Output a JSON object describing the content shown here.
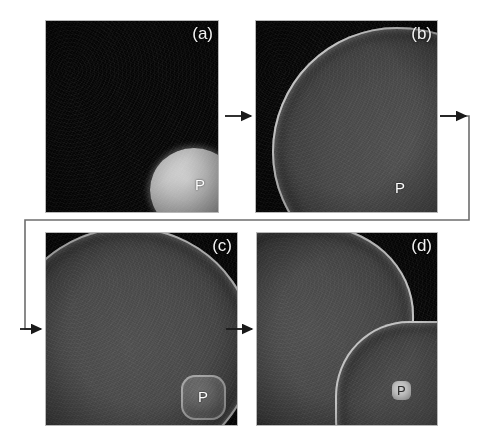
{
  "figure": {
    "page_number_artifact": "",
    "background_color": "#ffffff",
    "panel_background_color": "#050505",
    "label_color": "#f2f2f2",
    "arrow_color": "#1a1a1a"
  },
  "panels": [
    {
      "id": "a",
      "label": "(a)",
      "marker_label": "P",
      "description": "dark substrate with single small bright rounded particle at lower right",
      "feature_count": 1
    },
    {
      "id": "b",
      "label": "(b)",
      "marker_label": "P",
      "description": "single particle grown into large lobe filling most of the frame",
      "feature_count": 1
    },
    {
      "id": "c",
      "label": "(c)",
      "marker_label": "P",
      "description": "large lobe occupying upper left plus a small rounded-square particle at lower right",
      "feature_count": 2
    },
    {
      "id": "d",
      "label": "(d)",
      "marker_label": "P",
      "description": "two large grown lobes meeting near frame centre, small marker particle at lower right",
      "feature_count": 2
    }
  ],
  "arrows": [
    {
      "name": "a-to-b",
      "from": "a",
      "to": "b",
      "path": "straight-right"
    },
    {
      "name": "b-to-c",
      "from": "b",
      "to": "c",
      "path": "routed-right-down-left-down-right"
    },
    {
      "name": "c-to-d",
      "from": "c",
      "to": "d",
      "path": "straight-right"
    }
  ]
}
